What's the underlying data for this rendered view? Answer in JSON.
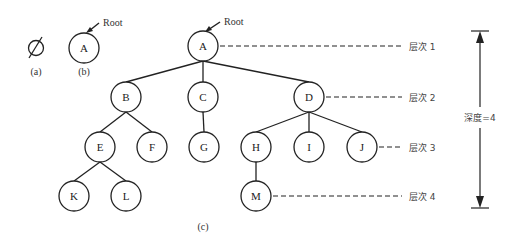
{
  "figure": {
    "parts": [
      {
        "id": "a",
        "caption": "(a)",
        "content": "Ø",
        "description": "empty tree"
      },
      {
        "id": "b",
        "caption": "(b)",
        "root_label": "Root",
        "nodes": [
          "A"
        ]
      },
      {
        "id": "c",
        "caption": "(c)",
        "root_label": "Root"
      }
    ],
    "tree_c": {
      "nodes": [
        {
          "id": "A",
          "x": 203,
          "y": 46
        },
        {
          "id": "B",
          "x": 126,
          "y": 97
        },
        {
          "id": "C",
          "x": 203,
          "y": 97
        },
        {
          "id": "D",
          "x": 309,
          "y": 97
        },
        {
          "id": "E",
          "x": 100,
          "y": 147
        },
        {
          "id": "F",
          "x": 152,
          "y": 147
        },
        {
          "id": "G",
          "x": 204,
          "y": 147
        },
        {
          "id": "H",
          "x": 256,
          "y": 147
        },
        {
          "id": "I",
          "x": 309,
          "y": 147
        },
        {
          "id": "J",
          "x": 362,
          "y": 147
        },
        {
          "id": "K",
          "x": 74,
          "y": 196
        },
        {
          "id": "L",
          "x": 126,
          "y": 196
        },
        {
          "id": "M",
          "x": 256,
          "y": 196
        }
      ],
      "edges": [
        [
          "A",
          "B"
        ],
        [
          "A",
          "C"
        ],
        [
          "A",
          "D"
        ],
        [
          "B",
          "E"
        ],
        [
          "B",
          "F"
        ],
        [
          "C",
          "G"
        ],
        [
          "D",
          "H"
        ],
        [
          "D",
          "I"
        ],
        [
          "D",
          "J"
        ],
        [
          "E",
          "K"
        ],
        [
          "E",
          "L"
        ],
        [
          "H",
          "M"
        ]
      ]
    },
    "levels": [
      {
        "label": "层次 1",
        "y": 46
      },
      {
        "label": "层次 2",
        "y": 97
      },
      {
        "label": "层次 3",
        "y": 147
      },
      {
        "label": "层次 4",
        "y": 196
      }
    ],
    "depth_label": "深度=4"
  }
}
